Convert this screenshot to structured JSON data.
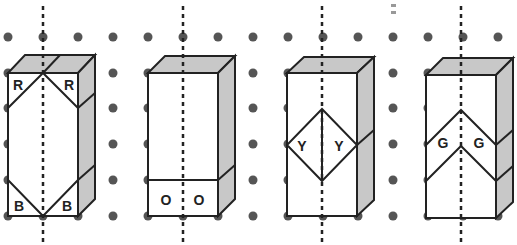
{
  "colors": {
    "dot": "#555555",
    "edge": "#222222",
    "shade": "#c8c8c8",
    "background": "#ffffff"
  },
  "grid": {
    "xs": [
      8,
      43,
      78,
      113,
      148,
      183,
      218,
      253,
      288,
      323,
      358,
      393,
      428,
      463,
      498
    ],
    "ys": [
      37,
      73,
      108,
      144,
      180,
      216
    ]
  },
  "figures": [
    {
      "id": "figure-1",
      "axis_x": 43,
      "labels": [
        {
          "text": "R",
          "x": 18,
          "y": 85
        },
        {
          "text": "R",
          "x": 69,
          "y": 85
        },
        {
          "text": "B",
          "x": 19,
          "y": 206
        },
        {
          "text": "B",
          "x": 67,
          "y": 206
        }
      ]
    },
    {
      "id": "figure-2",
      "axis_x": 183,
      "labels": [
        {
          "text": "O",
          "x": 166,
          "y": 200
        },
        {
          "text": "O",
          "x": 199,
          "y": 200
        }
      ]
    },
    {
      "id": "figure-3",
      "axis_x": 322,
      "labels": [
        {
          "text": "Y",
          "x": 302,
          "y": 146
        },
        {
          "text": "Y",
          "x": 339,
          "y": 146
        }
      ]
    },
    {
      "id": "figure-4",
      "axis_x": 461,
      "labels": [
        {
          "text": "G",
          "x": 443,
          "y": 143
        },
        {
          "text": "G",
          "x": 479,
          "y": 143
        }
      ]
    }
  ]
}
